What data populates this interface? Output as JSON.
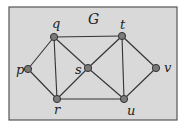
{
  "diagram": {
    "title": "G",
    "frame": {
      "x": 9,
      "y": 7,
      "width": 168,
      "height": 113,
      "fill": "#d9d9d9",
      "stroke": "#555555"
    },
    "colors": {
      "edge": "#333333",
      "node_fill": "#7a7a7a",
      "node_stroke": "#333333",
      "label": "#222222"
    },
    "nodes": [
      {
        "id": "p",
        "label": "p",
        "x": 28,
        "y": 69,
        "lx": 16,
        "ly": 74
      },
      {
        "id": "q",
        "label": "q",
        "x": 54,
        "y": 37,
        "lx": 52,
        "ly": 28
      },
      {
        "id": "r",
        "label": "r",
        "x": 57,
        "y": 99,
        "lx": 54,
        "ly": 114
      },
      {
        "id": "s",
        "label": "s",
        "x": 88,
        "y": 68,
        "lx": 75,
        "ly": 74
      },
      {
        "id": "t",
        "label": "t",
        "x": 122,
        "y": 36,
        "lx": 120,
        "ly": 29
      },
      {
        "id": "u",
        "label": "u",
        "x": 124,
        "y": 99,
        "lx": 127,
        "ly": 115
      },
      {
        "id": "v",
        "label": "v",
        "x": 156,
        "y": 68,
        "lx": 164,
        "ly": 72
      }
    ],
    "edges": [
      [
        "q",
        "t"
      ],
      [
        "q",
        "p"
      ],
      [
        "q",
        "r"
      ],
      [
        "q",
        "s"
      ],
      [
        "p",
        "r"
      ],
      [
        "r",
        "s"
      ],
      [
        "r",
        "u"
      ],
      [
        "s",
        "t"
      ],
      [
        "s",
        "u"
      ],
      [
        "t",
        "u"
      ],
      [
        "t",
        "v"
      ],
      [
        "u",
        "v"
      ]
    ]
  }
}
